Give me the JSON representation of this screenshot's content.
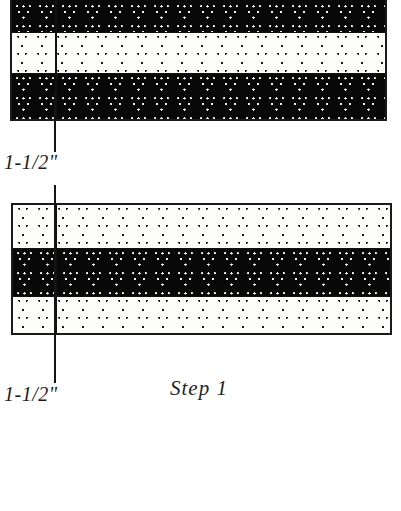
{
  "figure": {
    "caption": "Step 1",
    "background_color": "#ffffff",
    "dimension_labels": [
      {
        "id": "upper",
        "text": "1-1/2\""
      },
      {
        "id": "lower",
        "text": "1-1/2\""
      }
    ]
  },
  "boards": [
    {
      "id": "top-assembly",
      "name": "upper-laminated-board",
      "clipped_at_top": true,
      "plies": [
        {
          "id": "t1",
          "shade": "dark",
          "color": "#080808",
          "height_px": 50
        },
        {
          "id": "t2",
          "shade": "light",
          "color": "#fdfdfb",
          "height_px": 41
        },
        {
          "id": "t3",
          "shade": "dark",
          "color": "#080808",
          "height_px": 48
        }
      ]
    },
    {
      "id": "bottom-assembly",
      "name": "lower-laminated-board",
      "clipped_at_top": false,
      "plies": [
        {
          "id": "b1",
          "shade": "light",
          "color": "#fdfdfb",
          "height_px": 43
        },
        {
          "id": "b2",
          "shade": "dark",
          "color": "#080808",
          "height_px": 48
        },
        {
          "id": "b3",
          "shade": "light",
          "color": "#fdfdfb",
          "height_px": 41
        }
      ]
    }
  ],
  "extension_lines": [
    {
      "id": "upper",
      "color": "#141414"
    },
    {
      "id": "mid",
      "color": "#141414"
    },
    {
      "id": "lower",
      "color": "#141414"
    }
  ]
}
